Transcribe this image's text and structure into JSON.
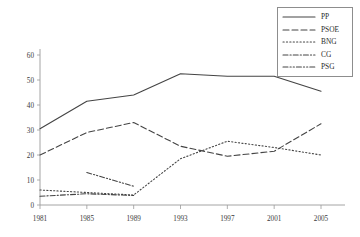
{
  "chart_data": {
    "type": "line",
    "title": "",
    "xlabel": "",
    "ylabel": "",
    "categories": [
      "1981",
      "1985",
      "1989",
      "1993",
      "1997",
      "2001",
      "2005"
    ],
    "x": [
      1981,
      1985,
      1989,
      1993,
      1997,
      2001,
      2005
    ],
    "xlim": [
      1979.5,
      2007
    ],
    "ylim": [
      0,
      60
    ],
    "yticks": [
      0,
      10,
      20,
      30,
      40,
      50,
      60
    ],
    "ytick_labels": [
      "0",
      "10",
      "20",
      "30",
      "40",
      "50",
      "60"
    ],
    "grid": false,
    "legend_position": "top-right",
    "series": [
      {
        "name": "PP",
        "style": "solid",
        "color": "#444444",
        "values": [
          30.5,
          41.5,
          44.0,
          52.5,
          51.5,
          51.5,
          45.5
        ]
      },
      {
        "name": "PSOE",
        "style": "dashed",
        "color": "#444444",
        "values": [
          20.0,
          29.0,
          33.0,
          23.5,
          19.5,
          21.5,
          32.5
        ]
      },
      {
        "name": "BNG",
        "style": "dotted",
        "color": "#444444",
        "values": [
          6.0,
          5.0,
          4.0,
          18.5,
          25.5,
          23.0,
          20.0
        ]
      },
      {
        "name": "CG",
        "style": "dash-dot",
        "color": "#444444",
        "values": [
          3.5,
          4.5,
          3.8,
          null,
          null,
          null,
          null
        ]
      },
      {
        "name": "PSG",
        "style": "dash-dot-dot",
        "color": "#444444",
        "values": [
          null,
          13.0,
          7.5,
          null,
          null,
          null,
          null
        ]
      }
    ]
  },
  "legend": {
    "entries": [
      {
        "label": "PP"
      },
      {
        "label": "PSOE"
      },
      {
        "label": "BNG"
      },
      {
        "label": "CG"
      },
      {
        "label": "PSG"
      }
    ]
  },
  "axes": {
    "y_labels": [
      "60",
      "50",
      "40",
      "30",
      "20",
      "10",
      "0"
    ],
    "x_labels": [
      "1981",
      "1985",
      "1989",
      "1993",
      "1997",
      "2001",
      "2005"
    ]
  },
  "colors": {
    "axis": "#9a9a9a",
    "line": "#444444",
    "text": "#2b2b2b",
    "legend_border": "#8d8d8d",
    "background": "#ffffff"
  }
}
